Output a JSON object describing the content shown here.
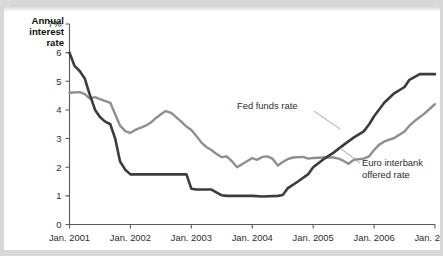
{
  "chart_data": {
    "type": "line",
    "title": "",
    "xlabel": "",
    "ylabel": "Annual interest rate",
    "ylabel_lines": [
      "Annual",
      "interest",
      "rate"
    ],
    "ylim": [
      0,
      7
    ],
    "xlim": [
      2001.0,
      2007.0
    ],
    "grid": false,
    "legend_position": "inline-annotations",
    "y_tick_labels": [
      "7%",
      "6",
      "5",
      "4",
      "3",
      "2",
      "1",
      "0"
    ],
    "y_ticks": [
      7,
      6,
      5,
      4,
      3,
      2,
      1,
      0
    ],
    "x_tick_labels": [
      "Jan. 2001",
      "Jan. 2002",
      "Jan. 2003",
      "Jan. 2004",
      "Jan. 2005",
      "Jan. 2006",
      "Jan. 2007"
    ],
    "x_ticks": [
      2001,
      2002,
      2003,
      2004,
      2005,
      2006,
      2007
    ],
    "series": [
      {
        "name": "Fed funds rate",
        "color": "#3c3c3c",
        "x": [
          2001.0,
          2001.08,
          2001.17,
          2001.25,
          2001.33,
          2001.42,
          2001.5,
          2001.58,
          2001.67,
          2001.75,
          2001.83,
          2001.92,
          2002.0,
          2002.17,
          2002.42,
          2002.67,
          2002.92,
          2003.0,
          2003.08,
          2003.17,
          2003.33,
          2003.5,
          2003.58,
          2003.75,
          2004.0,
          2004.17,
          2004.42,
          2004.5,
          2004.58,
          2004.75,
          2004.92,
          2005.0,
          2005.17,
          2005.33,
          2005.5,
          2005.67,
          2005.83,
          2005.92,
          2006.0,
          2006.17,
          2006.33,
          2006.5,
          2006.58,
          2006.75,
          2006.92,
          2007.0
        ],
        "y": [
          6.0,
          5.55,
          5.35,
          5.1,
          4.55,
          4.0,
          3.75,
          3.6,
          3.5,
          3.0,
          2.2,
          1.9,
          1.75,
          1.75,
          1.75,
          1.75,
          1.75,
          1.25,
          1.22,
          1.22,
          1.22,
          1.02,
          1.0,
          1.0,
          1.0,
          0.98,
          1.0,
          1.03,
          1.26,
          1.5,
          1.76,
          2.0,
          2.28,
          2.5,
          2.78,
          3.04,
          3.25,
          3.5,
          3.78,
          4.26,
          4.58,
          4.8,
          5.05,
          5.25,
          5.25,
          5.25
        ]
      },
      {
        "name": "Euro interbank offered rate",
        "color": "#8e8e8e",
        "x": [
          2001.0,
          2001.17,
          2001.25,
          2001.33,
          2001.42,
          2001.5,
          2001.58,
          2001.67,
          2001.75,
          2001.83,
          2001.92,
          2002.0,
          2002.08,
          2002.17,
          2002.25,
          2002.33,
          2002.42,
          2002.5,
          2002.58,
          2002.67,
          2002.83,
          2002.92,
          2003.0,
          2003.08,
          2003.17,
          2003.25,
          2003.33,
          2003.42,
          2003.5,
          2003.58,
          2003.67,
          2003.75,
          2003.83,
          2003.92,
          2004.0,
          2004.08,
          2004.17,
          2004.25,
          2004.33,
          2004.42,
          2004.5,
          2004.58,
          2004.67,
          2004.83,
          2004.92,
          2005.0,
          2005.17,
          2005.33,
          2005.42,
          2005.5,
          2005.58,
          2005.67,
          2005.83,
          2005.92,
          2006.0,
          2006.08,
          2006.17,
          2006.33,
          2006.5,
          2006.58,
          2006.67,
          2006.83,
          2006.92,
          2007.0
        ],
        "y": [
          4.6,
          4.62,
          4.55,
          4.4,
          4.45,
          4.38,
          4.32,
          4.25,
          3.85,
          3.45,
          3.25,
          3.2,
          3.3,
          3.38,
          3.45,
          3.55,
          3.72,
          3.85,
          3.96,
          3.9,
          3.6,
          3.42,
          3.3,
          3.1,
          2.85,
          2.7,
          2.6,
          2.45,
          2.35,
          2.38,
          2.2,
          2.0,
          2.1,
          2.22,
          2.32,
          2.26,
          2.36,
          2.38,
          2.3,
          2.06,
          2.18,
          2.28,
          2.34,
          2.36,
          2.3,
          2.32,
          2.34,
          2.34,
          2.3,
          2.22,
          2.12,
          2.26,
          2.3,
          2.38,
          2.6,
          2.78,
          2.9,
          3.02,
          3.25,
          3.45,
          3.62,
          3.88,
          4.05,
          4.2
        ]
      }
    ],
    "annotations": [
      {
        "name": "fed-funds-rate-label",
        "text": "Fed funds rate",
        "lines": [
          "Fed funds rate"
        ],
        "x_px": 233,
        "y_px": 104,
        "leader": {
          "x1": 310,
          "y1": 106,
          "x2": 336,
          "y2": 124
        }
      },
      {
        "name": "euro-interbank-offered-rate-label",
        "text": "Euro interbank offered rate",
        "lines": [
          "Euro interbank",
          "offered rate"
        ],
        "x_px": 358,
        "y_px": 161,
        "leader": {
          "x1": 356,
          "y1": 158,
          "x2": 336,
          "y2": 143
        }
      }
    ]
  },
  "colors": {
    "fed_funds": "#3c3c3c",
    "euro_interbank": "#8e8e8e",
    "axis": "#5a5a5a",
    "text": "#2b2b2b",
    "page_background": "#d8d8d8",
    "panel_background": "#ffffff"
  }
}
